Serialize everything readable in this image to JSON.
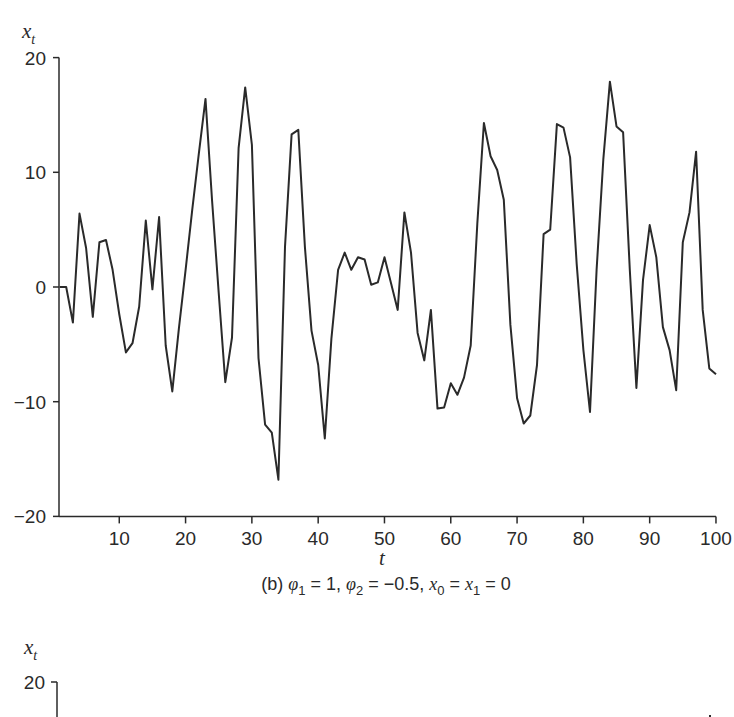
{
  "chart_data": [
    {
      "type": "line",
      "panel": "b",
      "title": "",
      "caption": "(b) φ₁ = 1, φ₂ = −0.5, x₀ = x₁ = 0",
      "caption_parts": {
        "prefix": "(b) ",
        "phi": "φ",
        "p1_sub": "1",
        "p1_val": " = 1, ",
        "p2_sub": "2",
        "p2_val": " = −0.5, ",
        "x": "x",
        "x0_sub": "0",
        "eq": " = ",
        "x1_sub": "1",
        "tail": " = 0"
      },
      "xlabel": "t",
      "ylabel": "x",
      "ylabel_sub": "t",
      "xlim": [
        1,
        100
      ],
      "ylim": [
        -20,
        20
      ],
      "grid": false,
      "legend": null,
      "x_ticks": [
        10,
        20,
        30,
        40,
        50,
        60,
        70,
        80,
        90,
        100
      ],
      "x_tick_labels": [
        "10",
        "20",
        "30",
        "40",
        "50",
        "60",
        "70",
        "80",
        "90",
        "100"
      ],
      "y_ticks": [
        20,
        10,
        0,
        -10,
        -20
      ],
      "y_tick_labels": [
        "20",
        "10",
        "0",
        "−10",
        "−20"
      ],
      "series": [
        {
          "name": "x_t",
          "x": [
            1,
            2,
            3,
            4,
            5,
            6,
            7,
            8,
            9,
            10,
            11,
            12,
            13,
            14,
            15,
            16,
            17,
            18,
            19,
            20,
            21,
            22,
            23,
            24,
            25,
            26,
            27,
            28,
            29,
            30,
            31,
            32,
            33,
            34,
            35,
            36,
            37,
            38,
            39,
            40,
            41,
            42,
            43,
            44,
            45,
            46,
            47,
            48,
            49,
            50,
            51,
            52,
            53,
            54,
            55,
            56,
            57,
            58,
            59,
            60,
            61,
            62,
            63,
            64,
            65,
            66,
            67,
            68,
            69,
            70,
            71,
            72,
            73,
            74,
            75,
            76,
            77,
            78,
            79,
            80,
            81,
            82,
            83,
            84,
            85,
            86,
            87,
            88,
            89,
            90,
            91,
            92,
            93,
            94,
            95,
            96,
            97,
            98,
            99,
            100
          ],
          "values": [
            0,
            0,
            -3.1,
            6.4,
            3.4,
            -2.6,
            3.9,
            4.1,
            1.5,
            -2.4,
            -5.7,
            -4.9,
            -1.7,
            5.8,
            -0.2,
            6.1,
            -5.1,
            -9.1,
            -3.6,
            1.5,
            6.7,
            11.6,
            16.4,
            7.5,
            -0.5,
            -8.3,
            -4.4,
            12.1,
            17.4,
            12.4,
            -6.2,
            -12.0,
            -12.7,
            -16.8,
            3.5,
            13.3,
            13.7,
            3.5,
            -3.8,
            -6.8,
            -13.2,
            -4.5,
            1.5,
            3.0,
            1.5,
            2.6,
            2.4,
            0.2,
            0.4,
            2.6,
            0.3,
            -2.0,
            6.5,
            3.0,
            -4.0,
            -6.4,
            -2.0,
            -10.6,
            -10.5,
            -8.4,
            -9.4,
            -7.9,
            -5.1,
            5.5,
            14.3,
            11.4,
            10.2,
            7.6,
            -3.3,
            -9.7,
            -11.9,
            -11.2,
            -6.8,
            4.6,
            5.0,
            14.2,
            13.9,
            11.3,
            2.0,
            -5.5,
            -10.9,
            1.5,
            11.1,
            17.9,
            14.0,
            13.5,
            1.5,
            -8.8,
            0.6,
            5.4,
            2.6,
            -3.5,
            -5.5,
            -9.0,
            3.9,
            6.5,
            11.8,
            -2.0,
            -7.1,
            -7.6
          ]
        }
      ]
    },
    {
      "type": "line",
      "panel": "next (partially visible)",
      "ylabel": "x",
      "ylabel_sub": "t",
      "y_ticks": [
        20
      ],
      "y_tick_labels": [
        "20"
      ]
    }
  ],
  "figure": {
    "line_color": "#2a2a2a",
    "axis_color": "#2a2a2a",
    "background": "#ffffff"
  }
}
